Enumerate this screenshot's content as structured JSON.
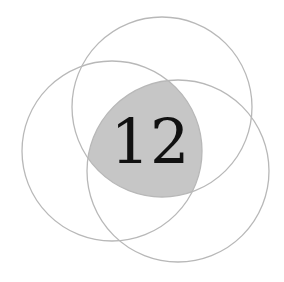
{
  "diagram": {
    "type": "venn",
    "sets": 3,
    "circles": [
      {
        "name": "top",
        "cx": 162,
        "cy": 107,
        "r": 90
      },
      {
        "name": "left",
        "cx": 112,
        "cy": 151,
        "r": 90
      },
      {
        "name": "right",
        "cx": 178,
        "cy": 171,
        "r": 91
      }
    ],
    "center_label": "12",
    "colors": {
      "outline": "#b8b8b8",
      "intersection_fill": "#c6c6c6",
      "text": "#111111",
      "background": "#ffffff"
    }
  }
}
